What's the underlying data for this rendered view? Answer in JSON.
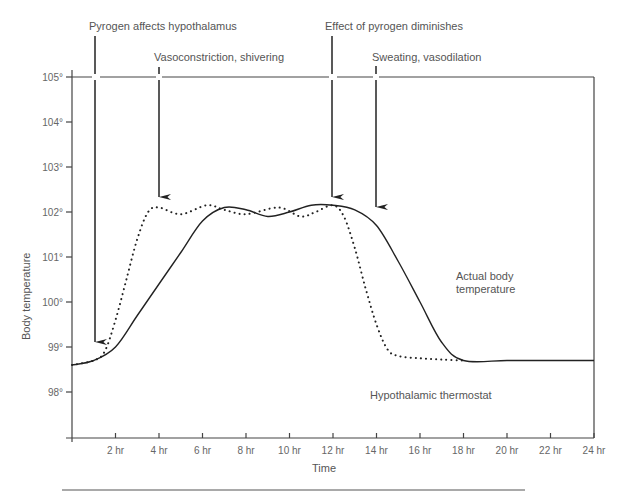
{
  "chart_data": {
    "type": "line",
    "title": "",
    "xlabel": "Time",
    "ylabel": "Body temperature",
    "xlim": [
      0,
      24
    ],
    "ylim": [
      97.2,
      105
    ],
    "x_ticks": [
      "2 hr",
      "4 hr",
      "6 hr",
      "8 hr",
      "10 hr",
      "12 hr",
      "14 hr",
      "16 hr",
      "18 hr",
      "20 hr",
      "22 hr",
      "24 hr"
    ],
    "y_ticks": [
      "98°",
      "99°",
      "100°",
      "101°",
      "102°",
      "103°",
      "104°",
      "105°"
    ],
    "grid": false,
    "series": [
      {
        "name": "Actual body temperature",
        "style": "solid",
        "x": [
          0,
          1,
          2,
          3,
          4,
          5,
          6,
          7,
          8,
          9,
          10,
          11,
          12,
          13,
          14,
          15,
          16,
          17,
          18,
          20,
          22,
          24
        ],
        "values": [
          98.6,
          98.7,
          99.0,
          99.7,
          100.4,
          101.1,
          101.8,
          102.1,
          102.05,
          101.9,
          102.0,
          102.15,
          102.15,
          102.05,
          101.7,
          100.9,
          100.0,
          99.1,
          98.7,
          98.7,
          98.7,
          98.7
        ]
      },
      {
        "name": "Hypothalamic thermostat",
        "style": "dotted",
        "x": [
          0,
          1,
          1.5,
          2,
          2.5,
          3,
          3.5,
          4,
          5,
          6.2,
          7,
          8,
          9.5,
          10.5,
          11.2,
          12,
          12.5,
          13,
          13.5,
          14,
          14.5,
          15,
          16,
          17,
          18
        ],
        "values": [
          98.6,
          98.7,
          98.9,
          99.6,
          100.5,
          101.4,
          102.0,
          102.1,
          101.95,
          102.15,
          102.05,
          101.95,
          102.1,
          101.9,
          102.0,
          102.15,
          101.9,
          101.2,
          100.3,
          99.5,
          98.95,
          98.8,
          98.75,
          98.72,
          98.7
        ]
      }
    ],
    "annotations": [
      {
        "text": "Pyrogen affects hypothalamus",
        "arrow_x": 1.0
      },
      {
        "text": "Vasoconstriction, shivering",
        "arrow_x": 4.0
      },
      {
        "text": "Effect of pyrogen diminishes",
        "arrow_x": 12.0
      },
      {
        "text": "Sweating, vasodilation",
        "arrow_x": 14.0
      },
      {
        "text": "Actual body temperature"
      },
      {
        "text": "Hypothalamic thermostat"
      }
    ]
  },
  "labels": {
    "ann1": "Pyrogen affects hypothalamus",
    "ann2": "Vasoconstriction, shivering",
    "ann3": "Effect of pyrogen diminishes",
    "ann4": "Sweating, vasodilation",
    "actual_line1": "Actual body",
    "actual_line2": "temperature",
    "thermostat": "Hypothalamic thermostat",
    "xlabel": "Time",
    "ylabel": "Body temperature"
  }
}
